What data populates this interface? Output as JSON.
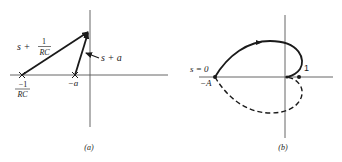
{
  "panel_a": {
    "caption": "(a)",
    "vector_long_label": {
      "prefix": "s  +",
      "num": "1",
      "den": "RC"
    },
    "vector_short_label": "s  +  a",
    "pole_rc_label": {
      "num": "−1",
      "den": "RC"
    },
    "pole_a_label": "−a"
  },
  "panel_b": {
    "caption": "(b)",
    "origin_label": "s = 0",
    "neg_a_label": "−A",
    "one_label": "1"
  },
  "colors": {
    "ink": "#1a1a1a",
    "background": "#ffffff"
  }
}
